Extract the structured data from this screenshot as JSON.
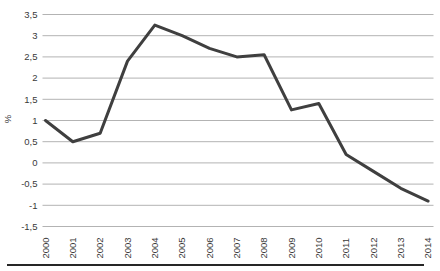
{
  "chart_data": {
    "type": "line",
    "title": "",
    "xlabel": "",
    "ylabel": "%",
    "categories": [
      "2000",
      "2001",
      "2002",
      "2003",
      "2004",
      "2005",
      "2006",
      "2007",
      "2008",
      "2009",
      "2010",
      "2011",
      "2012",
      "2013",
      "2014"
    ],
    "series": [
      {
        "name": "series-1",
        "values": [
          1.0,
          0.5,
          0.7,
          2.4,
          3.25,
          3.0,
          2.7,
          2.5,
          2.55,
          1.25,
          1.4,
          0.2,
          -0.2,
          -0.6,
          -0.9
        ]
      }
    ],
    "ylim": [
      -1.5,
      3.5
    ],
    "ytick_step": 0.5,
    "yticks": [
      {
        "value": 3.5,
        "label": "3,5"
      },
      {
        "value": 3.0,
        "label": "3"
      },
      {
        "value": 2.5,
        "label": "2,5"
      },
      {
        "value": 2.0,
        "label": "2"
      },
      {
        "value": 1.5,
        "label": "1,5"
      },
      {
        "value": 1.0,
        "label": "1"
      },
      {
        "value": 0.5,
        "label": "0,5"
      },
      {
        "value": 0.0,
        "label": "0"
      },
      {
        "value": -0.5,
        "label": "-0,5"
      },
      {
        "value": -1.0,
        "label": "-1"
      },
      {
        "value": -1.5,
        "label": "-1,5"
      }
    ],
    "grid": true,
    "legend": "none",
    "decimal_separator": ","
  },
  "style": {
    "line_color": "#3f3f3f",
    "grid_color": "#b3b3b3",
    "text_color": "#3a3a3a",
    "rule_color": "#262626",
    "background": "#ffffff"
  }
}
